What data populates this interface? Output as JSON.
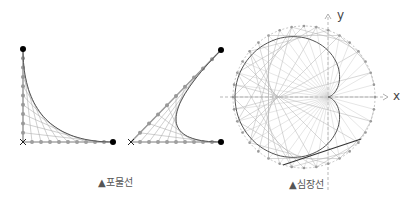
{
  "captions": {
    "parabola": "▲포물선",
    "cardioid": "▲심장선"
  },
  "axes": {
    "x_label": "x",
    "y_label": "y"
  },
  "colors": {
    "dot": "#000000",
    "line": "#b0b0b0",
    "curve": "#555555",
    "bead": "#999999"
  },
  "chart_data": {
    "type": "diagram",
    "figures": [
      {
        "name": "parabola-envelope-right-angle",
        "corner": [
          23,
          142
        ],
        "end_a": [
          23,
          49
        ],
        "end_b": [
          113,
          142
        ],
        "divisions": 10
      },
      {
        "name": "parabola-envelope-acute-angle",
        "corner": [
          131,
          142
        ],
        "end_a": [
          221,
          50
        ],
        "end_b": [
          221,
          142
        ],
        "divisions": 10
      },
      {
        "name": "cardioid-envelope",
        "cusp": [
          328,
          97
        ],
        "circle_center": [
          304,
          97
        ],
        "circle_radius": 71,
        "points": 36,
        "tangent_line": [
          [
            283,
            165
          ],
          [
            361,
            139
          ]
        ]
      }
    ]
  }
}
